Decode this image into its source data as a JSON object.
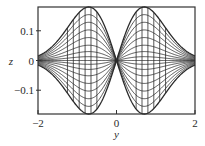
{
  "chart_data": {
    "type": "line",
    "title": "",
    "xlabel": "y",
    "ylabel": "z",
    "xlim": [
      -2,
      2
    ],
    "ylim": [
      -0.18,
      0.18
    ],
    "grid": false,
    "legend": null,
    "xticks": [
      {
        "value": -2,
        "label": "−2"
      },
      {
        "value": 0,
        "label": "0"
      },
      {
        "value": 2,
        "label": "2"
      }
    ],
    "yticks": [
      {
        "value": 0.1,
        "label": "0.1"
      },
      {
        "value": 0,
        "label": "0"
      },
      {
        "value": -0.1,
        "label": "−0.1"
      }
    ],
    "curve_family": {
      "description": "z = a · y · exp(-y²) for a set of amplitudes, plus vertical segments at fixed y spanning the envelope",
      "amplitudes": [
        -0.42,
        -0.36,
        -0.3,
        -0.24,
        -0.18,
        -0.12,
        -0.07,
        -0.03,
        0,
        0.03,
        0.07,
        0.12,
        0.18,
        0.24,
        0.3,
        0.36,
        0.42
      ],
      "envelope_amplitude": 0.42,
      "vertical_line_y": [
        -1.25,
        -1.1,
        -0.95,
        -0.8,
        -0.65,
        -0.5,
        0.5,
        0.65,
        0.8,
        0.95,
        1.1,
        1.25
      ],
      "peak": {
        "y": 0.707,
        "z": 0.18
      },
      "trough": {
        "y": -0.707,
        "z": -0.18
      }
    }
  },
  "style": {
    "line_color": "#2b2b2b",
    "frame_color": "#333333",
    "background": "#ffffff"
  }
}
